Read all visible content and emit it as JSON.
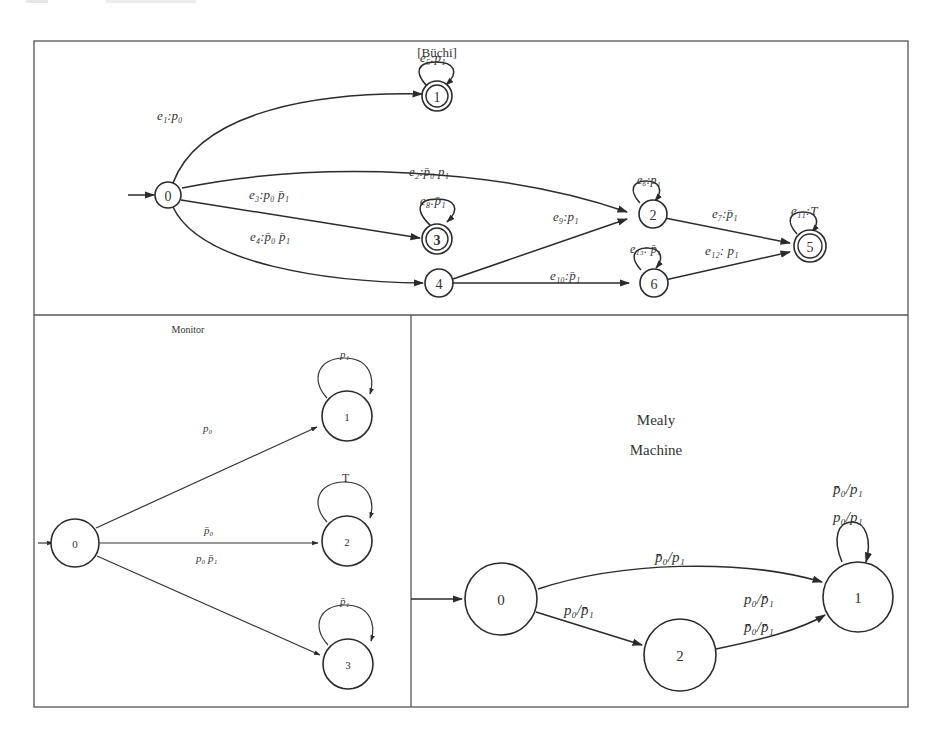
{
  "buchi": {
    "title": "[Büchi]",
    "states": [
      {
        "id": "0",
        "label": "0",
        "accepting": false,
        "initial": true
      },
      {
        "id": "1",
        "label": "1",
        "accepting": true
      },
      {
        "id": "2",
        "label": "2",
        "accepting": false
      },
      {
        "id": "3",
        "label": "3",
        "accepting": true
      },
      {
        "id": "4",
        "label": "4",
        "accepting": false
      },
      {
        "id": "5",
        "label": "5",
        "accepting": true
      },
      {
        "id": "6",
        "label": "6",
        "accepting": false
      }
    ],
    "edges": {
      "e1": {
        "from": "0",
        "to": "1",
        "label": "e₁:p₀"
      },
      "e2": {
        "from": "0",
        "to": "2",
        "label": "e₂:p̄₀ p₁"
      },
      "e3": {
        "from": "0",
        "to": "3",
        "label": "e₃:p₀ p̄₁"
      },
      "e4": {
        "from": "0",
        "to": "4",
        "label": "e₄:p̄₀ p̄₁"
      },
      "e5": {
        "from": "1",
        "to": "1",
        "label": "e₅:p₁"
      },
      "e6": {
        "from": "2",
        "to": "2",
        "label": "e₆:p₁"
      },
      "e7": {
        "from": "2",
        "to": "5",
        "label": "e₇:p̄₁"
      },
      "e8": {
        "from": "3",
        "to": "3",
        "label": "e₈:p̄₁"
      },
      "e9": {
        "from": "4",
        "to": "2",
        "label": "e₉:p₁"
      },
      "e10": {
        "from": "4",
        "to": "6",
        "label": "e₁₀:p̄₁"
      },
      "e11": {
        "from": "5",
        "to": "5",
        "label": "e₁₁:T"
      },
      "e12": {
        "from": "6",
        "to": "5",
        "label": "e₁₂: p₁"
      },
      "e13": {
        "from": "6",
        "to": "6",
        "label": "e₁₃: p̄₁"
      }
    }
  },
  "monitor": {
    "title": "Monitor",
    "states": [
      {
        "id": "0",
        "label": "0",
        "initial": true
      },
      {
        "id": "1",
        "label": "1"
      },
      {
        "id": "2",
        "label": "2"
      },
      {
        "id": "3",
        "label": "3"
      }
    ],
    "edges": {
      "to1": {
        "from": "0",
        "to": "1",
        "label": "p₀"
      },
      "to2_a": {
        "from": "0",
        "to": "2",
        "label": "p̄₀"
      },
      "to2_b": {
        "from": "0",
        "to": "2",
        "label": "p₀ p̄₁"
      },
      "to3": {
        "from": "0",
        "to": "3",
        "label": ""
      },
      "loop1": {
        "from": "1",
        "to": "1",
        "label": "p₁"
      },
      "loop2": {
        "from": "2",
        "to": "2",
        "label": "T"
      },
      "loop3": {
        "from": "3",
        "to": "3",
        "label": "p̄₁"
      }
    }
  },
  "mealy": {
    "title_line1": "Mealy",
    "title_line2": "Machine",
    "states": [
      {
        "id": "0",
        "label": "0",
        "initial": true
      },
      {
        "id": "1",
        "label": "1"
      },
      {
        "id": "2",
        "label": "2"
      }
    ],
    "edges": {
      "e01": {
        "from": "0",
        "to": "1",
        "label": "p̄₀/p₁"
      },
      "e02": {
        "from": "0",
        "to": "2",
        "label": "p₀/p̄₁"
      },
      "e21_a": {
        "from": "2",
        "to": "1",
        "label": "p₀/p̄₁"
      },
      "e21_b": {
        "from": "2",
        "to": "1",
        "label": "p̄₀/p̄₁"
      },
      "loop1_a": {
        "from": "1",
        "to": "1",
        "label": "p̄₀/p₁"
      },
      "loop1_b": {
        "from": "1",
        "to": "1",
        "label": "p₀/p₁"
      }
    }
  },
  "colors": {
    "stroke": "#2b2b2b",
    "text": "#333333",
    "frame": "#555555",
    "background": "#ffffff"
  }
}
